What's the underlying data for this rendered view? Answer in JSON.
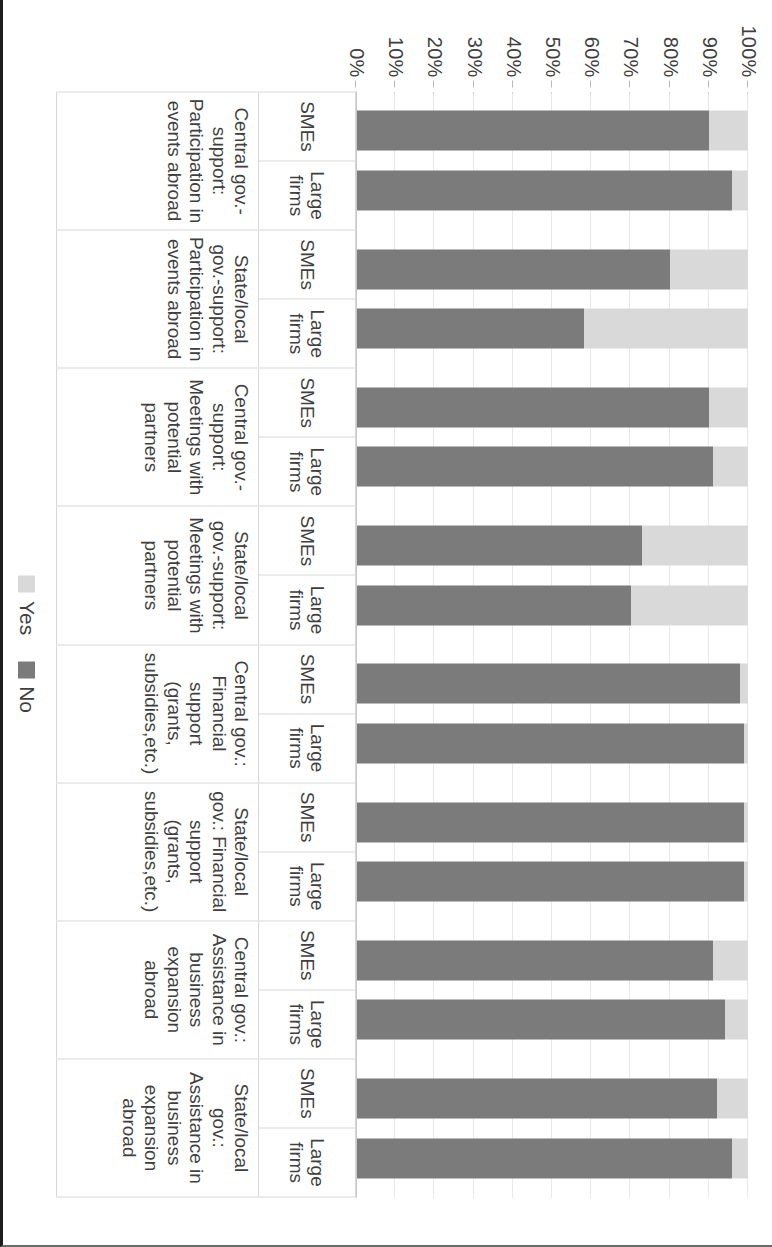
{
  "chart_data": {
    "type": "bar",
    "subtype": "100% stacked bar (rotated 90°)",
    "title": "",
    "xlabel": "",
    "ylabel": "",
    "ylim": [
      0,
      100
    ],
    "ytick_labels": [
      "100%",
      "90%",
      "80%",
      "70%",
      "60%",
      "50%",
      "40%",
      "30%",
      "20%",
      "10%",
      "0%"
    ],
    "ytick_values": [
      100,
      90,
      80,
      70,
      60,
      50,
      40,
      30,
      20,
      10,
      0
    ],
    "grid": true,
    "legend_position": "bottom",
    "legend": [
      "Yes",
      "No"
    ],
    "series": [
      {
        "name": "Yes",
        "color": "#d9d9d9",
        "values": [
          10,
          4,
          20,
          42,
          10,
          9,
          27,
          30,
          2,
          1,
          1,
          1,
          9,
          6,
          8,
          4
        ]
      },
      {
        "name": "No",
        "color": "#7b7b7b",
        "values": [
          90,
          96,
          80,
          58,
          90,
          91,
          73,
          70,
          98,
          99,
          99,
          99,
          91,
          94,
          92,
          96
        ]
      }
    ],
    "categories": [
      "SMEs",
      "Large firms",
      "SMEs",
      "Large firms",
      "SMEs",
      "Large firms",
      "SMEs",
      "Large firms",
      "SMEs",
      "Large firms",
      "SMEs",
      "Large firms",
      "SMEs",
      "Large firms",
      "SMEs",
      "Large firms"
    ],
    "groups": [
      {
        "label": "Central gov.-support: Participation in events abroad",
        "bars": [
          {
            "size": "SMEs",
            "yes": 10,
            "no": 90
          },
          {
            "size": "Large firms",
            "yes": 4,
            "no": 96
          }
        ]
      },
      {
        "label": "State/local gov.-support: Participation in events abroad",
        "bars": [
          {
            "size": "SMEs",
            "yes": 20,
            "no": 80
          },
          {
            "size": "Large firms",
            "yes": 42,
            "no": 58
          }
        ]
      },
      {
        "label": "Central gov.-support: Meetings with potential partners",
        "bars": [
          {
            "size": "SMEs",
            "yes": 10,
            "no": 90
          },
          {
            "size": "Large firms",
            "yes": 9,
            "no": 91
          }
        ]
      },
      {
        "label": "State/local gov.-support: Meetings with potential partners",
        "bars": [
          {
            "size": "SMEs",
            "yes": 27,
            "no": 73
          },
          {
            "size": "Large firms",
            "yes": 30,
            "no": 70
          }
        ]
      },
      {
        "label": "Central gov.: Financial support (grants, subsidies,etc.)",
        "bars": [
          {
            "size": "SMEs",
            "yes": 2,
            "no": 98
          },
          {
            "size": "Large firms",
            "yes": 1,
            "no": 99
          }
        ]
      },
      {
        "label": "State/local gov.: Financial support (grants, subsidies,etc.)",
        "bars": [
          {
            "size": "SMEs",
            "yes": 1,
            "no": 99
          },
          {
            "size": "Large firms",
            "yes": 1,
            "no": 99
          }
        ]
      },
      {
        "label": "Central gov.: Assistance in business expansion abroad",
        "bars": [
          {
            "size": "SMEs",
            "yes": 9,
            "no": 91
          },
          {
            "size": "Large firms",
            "yes": 6,
            "no": 94
          }
        ]
      },
      {
        "label": "State/local gov.: Assistance in business expansion abroad",
        "bars": [
          {
            "size": "SMEs",
            "yes": 8,
            "no": 92
          },
          {
            "size": "Large firms",
            "yes": 4,
            "no": 96
          }
        ]
      }
    ]
  },
  "legend": {
    "yes_label": "Yes",
    "no_label": "No",
    "yes_color": "#d9d9d9",
    "no_color": "#7b7b7b"
  }
}
